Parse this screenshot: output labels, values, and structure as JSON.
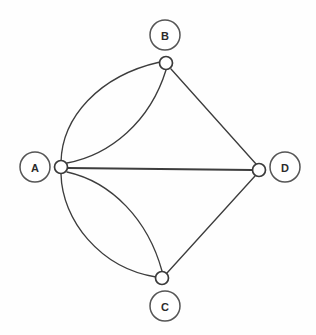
{
  "diagram": {
    "type": "multigraph",
    "canvas": {
      "width": 316,
      "height": 335,
      "background": "#fefefe"
    },
    "style": {
      "edge_color": "#3d3d3d",
      "node_stroke": "#3a3a3a",
      "node_fill": "#ffffff",
      "label_stroke": "#555555",
      "label_text_color": "#2b2b2b"
    },
    "nodes": [
      {
        "id": "A",
        "label": "A",
        "node_x": 61,
        "node_y": 167,
        "node_r": 6.5,
        "label_x": 35,
        "label_y": 167,
        "label_r": 15,
        "degree": 5
      },
      {
        "id": "B",
        "label": "B",
        "node_x": 166,
        "node_y": 63,
        "node_r": 6.5,
        "label_x": 165,
        "label_y": 35,
        "label_r": 15,
        "degree": 3
      },
      {
        "id": "C",
        "label": "C",
        "node_x": 162,
        "node_y": 278,
        "node_r": 6.5,
        "label_x": 165,
        "label_y": 306,
        "label_r": 15,
        "degree": 3
      },
      {
        "id": "D",
        "label": "D",
        "node_x": 259,
        "node_y": 170,
        "node_r": 6.5,
        "label_x": 285,
        "label_y": 167,
        "label_r": 15,
        "degree": 3
      }
    ],
    "edges": [
      {
        "id": "A-B-outer",
        "from": "A",
        "to": "B",
        "shape": "curve",
        "multiplicity_index": 1,
        "path": "M 61 162 C 62 118 98 76 160 62"
      },
      {
        "id": "A-B-inner",
        "from": "A",
        "to": "B",
        "shape": "curve",
        "multiplicity_index": 2,
        "path": "M 67 163 C 110 155 150 122 166 70"
      },
      {
        "id": "A-C-outer",
        "from": "A",
        "to": "C",
        "shape": "curve",
        "multiplicity_index": 1,
        "path": "M 61 174 C 62 220 100 268 156 277"
      },
      {
        "id": "A-C-inner",
        "from": "A",
        "to": "C",
        "shape": "curve",
        "multiplicity_index": 2,
        "path": "M 67 172 C 112 182 148 220 162 271"
      },
      {
        "id": "A-D",
        "from": "A",
        "to": "D",
        "shape": "line",
        "multiplicity_index": 1,
        "path": "M 68 168 L 252 170"
      },
      {
        "id": "B-D",
        "from": "B",
        "to": "D",
        "shape": "line",
        "multiplicity_index": 1,
        "path": "M 171 69 L 256 164"
      },
      {
        "id": "C-D",
        "from": "C",
        "to": "D",
        "shape": "line",
        "multiplicity_index": 1,
        "path": "M 167 273 L 255 176"
      }
    ],
    "adjacency_summary": [
      {
        "pair": "A-B",
        "count": 2
      },
      {
        "pair": "A-C",
        "count": 2
      },
      {
        "pair": "A-D",
        "count": 1
      },
      {
        "pair": "B-D",
        "count": 1
      },
      {
        "pair": "C-D",
        "count": 1
      }
    ]
  }
}
